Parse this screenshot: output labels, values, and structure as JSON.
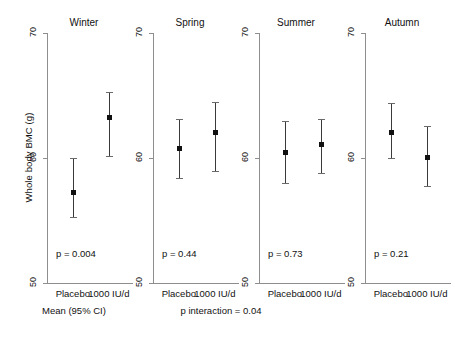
{
  "chart_data": {
    "type": "scatter",
    "title": "",
    "subtitle": "",
    "xlabel": "",
    "ylabel": "Whole body BMC (g)",
    "ylim": [
      50,
      70
    ],
    "yticks": [
      50,
      60,
      70
    ],
    "ytick_labels": [
      "50",
      "60",
      "70"
    ],
    "grid": false,
    "legend": "none",
    "error_bar_type": "Mean (95% CI)",
    "categories": [
      "Placebo",
      "1000 IU/d"
    ],
    "panels": [
      {
        "title": "Winter",
        "pvalue_label": "p = 0.004",
        "points": [
          {
            "group": "Placebo",
            "mean": 57.3,
            "ci_low": 55.3,
            "ci_high": 60.0
          },
          {
            "group": "1000 IU/d",
            "mean": 63.3,
            "ci_low": 60.2,
            "ci_high": 65.3
          }
        ]
      },
      {
        "title": "Spring",
        "pvalue_label": "p = 0.44",
        "points": [
          {
            "group": "Placebo",
            "mean": 60.8,
            "ci_low": 58.4,
            "ci_high": 63.1
          },
          {
            "group": "1000 IU/d",
            "mean": 62.1,
            "ci_low": 59.0,
            "ci_high": 64.5
          }
        ]
      },
      {
        "title": "Summer",
        "pvalue_label": "p = 0.73",
        "points": [
          {
            "group": "Placebo",
            "mean": 60.5,
            "ci_low": 58.0,
            "ci_high": 63.0
          },
          {
            "group": "1000 IU/d",
            "mean": 61.1,
            "ci_low": 58.8,
            "ci_high": 63.1
          }
        ]
      },
      {
        "title": "Autumn",
        "pvalue_label": "p = 0.21",
        "points": [
          {
            "group": "Placebo",
            "mean": 62.1,
            "ci_low": 60.0,
            "ci_high": 64.4
          },
          {
            "group": "1000 IU/d",
            "mean": 60.1,
            "ci_low": 57.8,
            "ci_high": 62.6
          }
        ]
      }
    ],
    "annotations": [
      {
        "name": "mean-ci-note",
        "text": "Mean (95% CI)"
      },
      {
        "name": "p-interaction",
        "text": "p interaction = 0.04"
      }
    ]
  },
  "axis": {
    "y_title": "Whole body BMC (g)",
    "y_tick_70": "70",
    "y_tick_60": "60",
    "y_tick_50": "50"
  },
  "panels": {
    "winter": {
      "title": "Winter",
      "pvalue": "p = 0.004",
      "x1": "Placebo",
      "x2": "1000 IU/d"
    },
    "spring": {
      "title": "Spring",
      "pvalue": "p = 0.44",
      "x1": "Placebo",
      "x2": "1000 IU/d"
    },
    "summer": {
      "title": "Summer",
      "pvalue": "p = 0.73",
      "x1": "Placebo",
      "x2": "1000 IU/d"
    },
    "autumn": {
      "title": "Autumn",
      "pvalue": "p = 0.21",
      "x1": "Placebo",
      "x2": "1000 IU/d"
    }
  },
  "footer": {
    "mean_ci": "Mean (95% CI)",
    "p_interaction": "p interaction = 0.04"
  },
  "colors": {
    "axis": "#8e8e8e",
    "marker": "#111111",
    "errorbar": "#3a3a3a",
    "text": "#111111",
    "background": "#ffffff"
  }
}
